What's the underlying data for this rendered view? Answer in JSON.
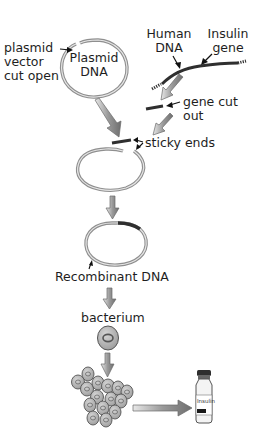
{
  "diagram": {
    "labels": {
      "plasmid_vector": [
        "plasmid",
        "vector",
        "cut open"
      ],
      "plasmid_dna": [
        "Plasmid",
        "DNA"
      ],
      "human_dna": [
        "Human",
        "DNA"
      ],
      "insulin_gene": [
        "Insulin",
        "gene"
      ],
      "gene_cut_out": [
        "gene cut",
        "out"
      ],
      "sticky_ends": "sticky ends",
      "recombinant_dna": "Recombinant DNA",
      "bacterium": "bacterium",
      "vial_label": "Insulin"
    },
    "steps": [
      "Plasmid vector cut open",
      "Insulin gene cut out of human DNA",
      "Sticky ends join gene into plasmid",
      "Recombinant DNA formed",
      "Recombinant DNA inserted into bacterium",
      "Bacteria multiply",
      "Insulin produced"
    ],
    "colors": {
      "plasmid_ring": "#9a9a9a",
      "dna_strand": "#3a3a3a",
      "arrow_fill": "#8c8c8c",
      "cell_fill": "#b8b8b8",
      "text": "#1e1e1e"
    }
  }
}
